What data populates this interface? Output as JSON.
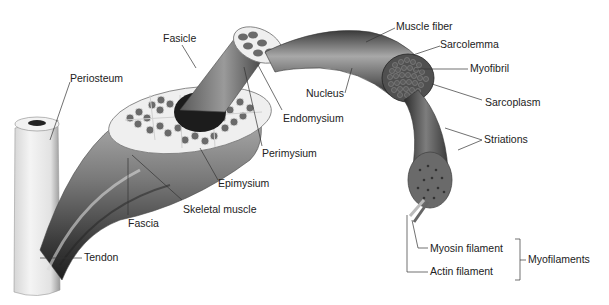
{
  "diagram": {
    "type": "anatomical-illustration",
    "colors": {
      "background": "#ffffff",
      "label_text": "#222222",
      "leader_line": "#333333",
      "muscle_dark": "#2a2a2a",
      "muscle_mid": "#6e6e6e",
      "muscle_light": "#b5b5b5",
      "bone_tendon": "#e8e8e8",
      "connective_tissue": "#f0f0f0"
    },
    "labels": {
      "periosteum": "Periosteum",
      "fasicle": "Fasicle",
      "endomysium": "Endomysium",
      "perimysium": "Perimysium",
      "epimysium": "Epimysium",
      "skeletal_muscle": "Skeletal muscle",
      "fascia": "Fascia",
      "tendon": "Tendon",
      "muscle_fiber": "Muscle fiber",
      "sarcolemma": "Sarcolemma",
      "myofibril": "Myofibril",
      "nucleus": "Nucleus",
      "sarcoplasm": "Sarcoplasm",
      "striations": "Striations",
      "myosin_filament": "Myosin filament",
      "actin_filament": "Actin filament",
      "myofilaments": "Myofilaments"
    }
  }
}
